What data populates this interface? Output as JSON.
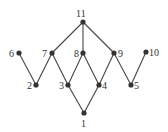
{
  "diagram": {
    "type": "hasse-diagram",
    "nodes": [
      {
        "id": "1",
        "label": "1",
        "x": 84,
        "y": 113,
        "lx": 81,
        "ly": 127
      },
      {
        "id": "2",
        "label": "2",
        "x": 36,
        "y": 85,
        "lx": 27,
        "ly": 89
      },
      {
        "id": "3",
        "label": "3",
        "x": 68,
        "y": 85,
        "lx": 59,
        "ly": 89
      },
      {
        "id": "4",
        "label": "4",
        "x": 99,
        "y": 85,
        "lx": 102,
        "ly": 89
      },
      {
        "id": "5",
        "label": "5",
        "x": 131,
        "y": 85,
        "lx": 134,
        "ly": 89
      },
      {
        "id": "6",
        "label": "6",
        "x": 19,
        "y": 53,
        "lx": 9,
        "ly": 57
      },
      {
        "id": "7",
        "label": "7",
        "x": 52,
        "y": 53,
        "lx": 42,
        "ly": 57
      },
      {
        "id": "8",
        "label": "8",
        "x": 83,
        "y": 53,
        "lx": 74,
        "ly": 57
      },
      {
        "id": "9",
        "label": "9",
        "x": 114,
        "y": 53,
        "lx": 118,
        "ly": 57
      },
      {
        "id": "10",
        "label": "10",
        "x": 146,
        "y": 52,
        "lx": 149,
        "ly": 56
      },
      {
        "id": "11",
        "label": "11",
        "x": 83,
        "y": 22,
        "lx": 76,
        "ly": 17
      }
    ],
    "edges": [
      [
        "11",
        "7"
      ],
      [
        "11",
        "8"
      ],
      [
        "11",
        "9"
      ],
      [
        "6",
        "2"
      ],
      [
        "7",
        "2"
      ],
      [
        "7",
        "3"
      ],
      [
        "8",
        "3"
      ],
      [
        "8",
        "4"
      ],
      [
        "9",
        "4"
      ],
      [
        "9",
        "5"
      ],
      [
        "10",
        "5"
      ],
      [
        "3",
        "1"
      ],
      [
        "4",
        "1"
      ]
    ]
  }
}
